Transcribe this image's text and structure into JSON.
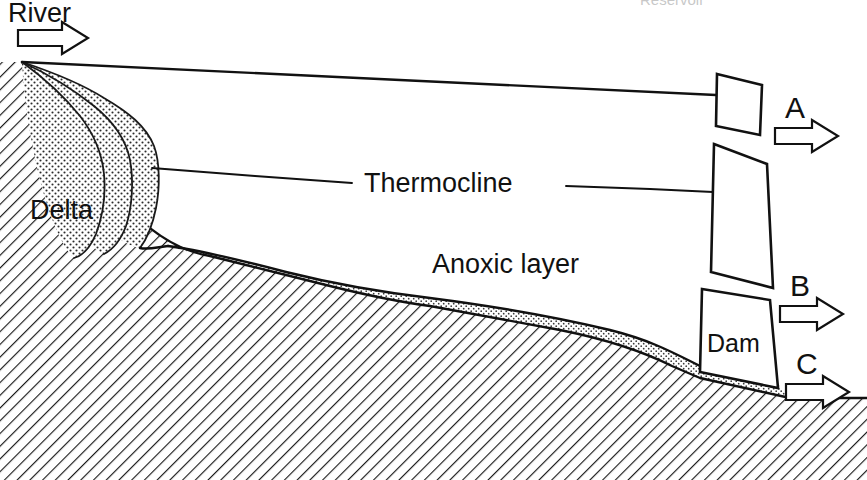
{
  "figure": {
    "kind": "reservoir-cross-section-diagram",
    "clipped_top_caption": "Reservoir",
    "labels": {
      "river": "River",
      "delta": "Delta",
      "thermocline": "Thermocline",
      "anoxic_layer": "Anoxic layer",
      "dam": "Dam"
    },
    "outlets": [
      {
        "id": "A",
        "label": "A",
        "level": "surface"
      },
      {
        "id": "B",
        "label": "B",
        "level": "mid-depth"
      },
      {
        "id": "C",
        "label": "C",
        "level": "bottom"
      }
    ],
    "flow_arrows": {
      "inflow": "river-inflow-arrow",
      "outflow_a": "outflow-arrow-a",
      "outflow_b": "outflow-arrow-b",
      "outflow_c": "outflow-arrow-c"
    },
    "icons": {
      "inflow_arrow": "arrow-right-icon",
      "outflow_arrow": "arrow-right-icon"
    },
    "colors": {
      "ink": "#111111",
      "background": "#ffffff",
      "stipple_fill": "#d9d9d9",
      "hatch_fill": "#ffffff",
      "hatch_line": "#1a1a1a"
    }
  }
}
